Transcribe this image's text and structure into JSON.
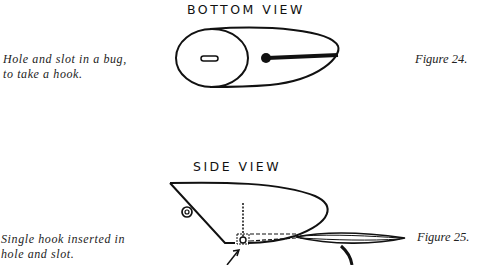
{
  "figure24": {
    "heading": "BOTTOM VIEW",
    "caption_line1": "Hole and slot in a bug,",
    "caption_line2": "to take a hook.",
    "label": "Figure 24."
  },
  "figure25": {
    "heading": "SIDE VIEW",
    "caption_line1": "Single hook inserted in",
    "caption_line2": "hole and slot.",
    "label": "Figure 25."
  }
}
